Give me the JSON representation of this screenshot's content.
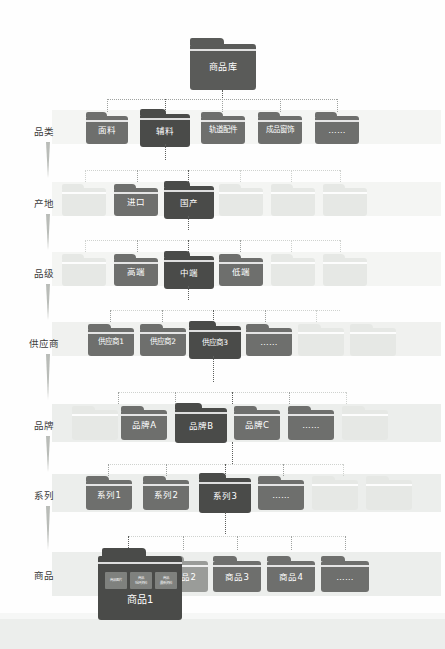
{
  "diagram": {
    "title": "商品库",
    "root": {
      "label": "商品库"
    },
    "levels": [
      {
        "axis": "品类",
        "nodes": [
          {
            "label": "面料",
            "state": "normal"
          },
          {
            "label": "辅料",
            "state": "active"
          },
          {
            "label": "轨道配件",
            "state": "normal"
          },
          {
            "label": "成品窗饰",
            "state": "normal"
          },
          {
            "label": "……",
            "state": "normal"
          }
        ]
      },
      {
        "axis": "产地",
        "nodes": [
          {
            "label": "",
            "state": "ghost"
          },
          {
            "label": "进口",
            "state": "normal"
          },
          {
            "label": "国产",
            "state": "active"
          },
          {
            "label": "",
            "state": "ghost"
          },
          {
            "label": "",
            "state": "ghost"
          },
          {
            "label": "",
            "state": "ghost"
          }
        ]
      },
      {
        "axis": "品级",
        "nodes": [
          {
            "label": "",
            "state": "ghost"
          },
          {
            "label": "高端",
            "state": "normal"
          },
          {
            "label": "中端",
            "state": "active"
          },
          {
            "label": "低端",
            "state": "normal"
          },
          {
            "label": "",
            "state": "ghost"
          },
          {
            "label": "",
            "state": "ghost"
          }
        ]
      },
      {
        "axis": "供应商",
        "nodes": [
          {
            "label": "供应商1",
            "state": "normal"
          },
          {
            "label": "供应商2",
            "state": "normal"
          },
          {
            "label": "供应商3",
            "state": "active"
          },
          {
            "label": "……",
            "state": "normal"
          },
          {
            "label": "",
            "state": "ghost"
          },
          {
            "label": "",
            "state": "ghost"
          }
        ]
      },
      {
        "axis": "品牌",
        "nodes": [
          {
            "label": "",
            "state": "ghost"
          },
          {
            "label": "品牌A",
            "state": "normal"
          },
          {
            "label": "品牌B",
            "state": "active"
          },
          {
            "label": "品牌C",
            "state": "normal"
          },
          {
            "label": "……",
            "state": "normal"
          },
          {
            "label": "",
            "state": "ghost"
          }
        ]
      },
      {
        "axis": "系列",
        "nodes": [
          {
            "label": "系列1",
            "state": "normal"
          },
          {
            "label": "系列2",
            "state": "normal"
          },
          {
            "label": "系列3",
            "state": "active"
          },
          {
            "label": "……",
            "state": "normal"
          },
          {
            "label": "",
            "state": "ghost"
          },
          {
            "label": "",
            "state": "ghost"
          }
        ]
      },
      {
        "axis": "商品",
        "nodes": [
          {
            "label": "商品1",
            "state": "active"
          },
          {
            "label": "商品2",
            "state": "ghost-mid"
          },
          {
            "label": "商品3",
            "state": "normal"
          },
          {
            "label": "商品4",
            "state": "normal"
          },
          {
            "label": "……",
            "state": "normal"
          }
        ]
      }
    ],
    "product_contents": [
      {
        "label": "商品图片"
      },
      {
        "label": "商品\n低环资料"
      },
      {
        "label": "商品\n最新资料"
      }
    ]
  },
  "colors": {
    "folder_normal": "#6e6f6d",
    "folder_active": "#4a4b49",
    "folder_root": "#5a5b59",
    "folder_ghost": "#e6e8e5",
    "row_band": "#f0f1ef",
    "connector": "#9fa2a0",
    "text_dark": "#3b3b3b",
    "page_bg": "#fefefe",
    "bottom_band": "#eceeec"
  }
}
